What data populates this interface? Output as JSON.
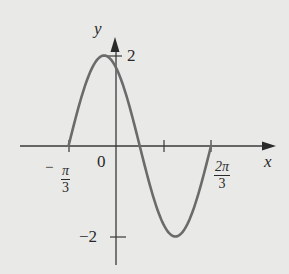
{
  "chart_data": {
    "type": "line",
    "title": "",
    "xlabel": "x",
    "ylabel": "y",
    "function": "y = 2 sin(2x + 2π/3)",
    "x_ticks": [
      {
        "value": -1.0472,
        "label_num": "π",
        "label_den": "3",
        "label_sign": "−"
      },
      {
        "value": 0,
        "label": "0"
      },
      {
        "value": 1.0472,
        "label": ""
      },
      {
        "value": 2.0944,
        "label_num": "2π",
        "label_den": "3",
        "label_sign": ""
      }
    ],
    "y_ticks": [
      {
        "value": 2,
        "label": "2"
      },
      {
        "value": -2,
        "label": "−2"
      }
    ],
    "x": [
      -1.0472,
      -0.7854,
      -0.5236,
      -0.2618,
      0,
      0.2618,
      0.5236,
      0.7854,
      1.0472,
      1.309,
      1.5708,
      1.8326,
      2.0944
    ],
    "y": [
      0,
      1,
      1.732,
      2,
      1.732,
      1,
      0,
      -1,
      -1.732,
      -2,
      -1.732,
      -1,
      0
    ],
    "xlim": [
      -1.45,
      2.7
    ],
    "ylim": [
      -2.4,
      2.4
    ],
    "grid": false,
    "legend": null
  },
  "labels": {
    "y_axis": "y",
    "x_axis": "x",
    "origin": "0",
    "y_max": "2",
    "y_min": "−2",
    "neg_pi_3_sign": "−",
    "neg_pi_3_num": "π",
    "neg_pi_3_den": "3",
    "two_pi_3_num": "2π",
    "two_pi_3_den": "3"
  }
}
